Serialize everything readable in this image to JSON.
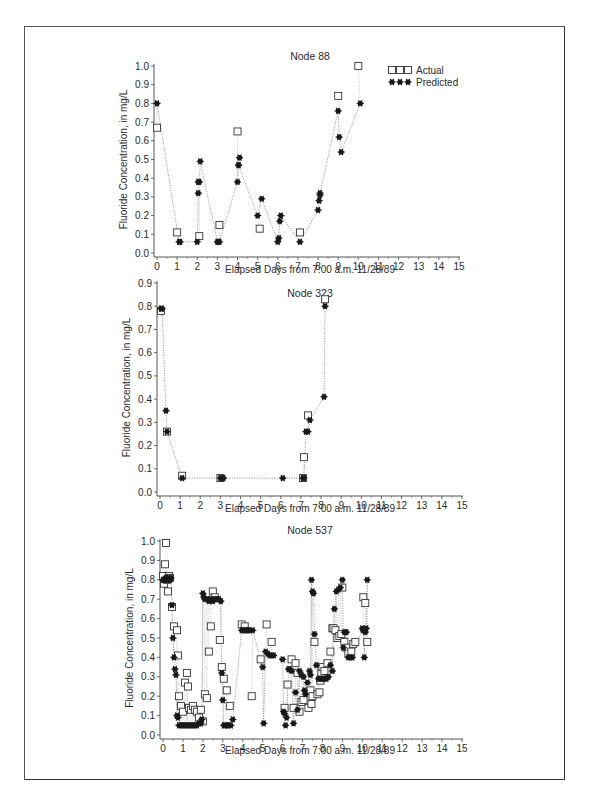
{
  "figure": {
    "caption_visible": false
  },
  "legend": {
    "actual_label": "Actual",
    "predicted_label": "Predicted",
    "actual_marker": "open-square",
    "predicted_marker": "filled-asterisk-dot"
  },
  "chart_data": [
    {
      "type": "scatter",
      "title": "Node 88",
      "xlabel": "Elapsed Days from 7:00 a.m. 11/28/89",
      "ylabel": "Fluoride Concentration, in mg/L",
      "xlim": [
        0,
        15
      ],
      "ylim": [
        0,
        1.0
      ],
      "xticks": [
        0,
        1,
        2,
        3,
        4,
        5,
        6,
        7,
        8,
        9,
        10,
        11,
        12,
        13,
        14,
        15
      ],
      "yticks": [
        0.0,
        0.1,
        0.2,
        0.3,
        0.4,
        0.5,
        0.6,
        0.7,
        0.8,
        0.9,
        1.0
      ],
      "legend_position": "top-right",
      "grid": false,
      "series": [
        {
          "name": "Actual",
          "marker": "open-square",
          "x": [
            0.0,
            1.0,
            2.1,
            3.1,
            4.0,
            5.1,
            7.1,
            9.0,
            10.0
          ],
          "y": [
            0.67,
            0.11,
            0.09,
            0.15,
            0.65,
            0.13,
            0.11,
            0.84,
            1.0
          ]
        },
        {
          "name": "Predicted",
          "marker": "filled-asterisk",
          "line": "dotted",
          "x": [
            0.0,
            1.1,
            1.15,
            2.0,
            2.05,
            2.05,
            2.1,
            2.15,
            3.0,
            3.05,
            3.1,
            4.0,
            4.05,
            4.1,
            4.05,
            5.0,
            5.2,
            6.0,
            6.05,
            6.1,
            6.15,
            7.1,
            8.0,
            8.05,
            8.1,
            8.1,
            9.0,
            9.05,
            9.15,
            10.1
          ],
          "y": [
            0.8,
            0.06,
            0.06,
            0.06,
            0.32,
            0.38,
            0.38,
            0.49,
            0.06,
            0.06,
            0.06,
            0.38,
            0.47,
            0.51,
            0.47,
            0.2,
            0.29,
            0.06,
            0.08,
            0.17,
            0.2,
            0.06,
            0.23,
            0.28,
            0.31,
            0.32,
            0.76,
            0.62,
            0.54,
            0.8
          ]
        }
      ]
    },
    {
      "type": "scatter",
      "title": "Node 323",
      "xlabel": "Elapsed Days from 7:00 a.m. 11/28/89",
      "ylabel": "Fluoride Concentration, in mg/L",
      "xlim": [
        0,
        15
      ],
      "ylim": [
        0,
        0.9
      ],
      "xticks": [
        0,
        1,
        2,
        3,
        4,
        5,
        6,
        7,
        8,
        9,
        10,
        11,
        12,
        13,
        14,
        15
      ],
      "yticks": [
        0.0,
        0.1,
        0.2,
        0.3,
        0.4,
        0.5,
        0.6,
        0.7,
        0.8,
        0.9
      ],
      "grid": false,
      "series": [
        {
          "name": "Actual",
          "marker": "open-square",
          "x": [
            0.05,
            0.35,
            1.1,
            3.0,
            7.1,
            7.15,
            7.35,
            8.2
          ],
          "y": [
            0.78,
            0.26,
            0.07,
            0.06,
            0.06,
            0.15,
            0.33,
            0.83
          ]
        },
        {
          "name": "Predicted",
          "marker": "filled-asterisk",
          "line": "dotted",
          "x": [
            0.05,
            0.1,
            0.3,
            0.35,
            1.1,
            3.0,
            3.05,
            3.15,
            6.1,
            7.1,
            7.15,
            7.25,
            7.35,
            7.45,
            8.15,
            8.2
          ],
          "y": [
            0.79,
            0.79,
            0.35,
            0.26,
            0.06,
            0.06,
            0.06,
            0.06,
            0.06,
            0.06,
            0.06,
            0.26,
            0.26,
            0.31,
            0.41,
            0.8
          ]
        }
      ]
    },
    {
      "type": "scatter",
      "title": "Node 537",
      "xlabel": "Elapsed Days from 7:00 a.m. 11/28/89",
      "ylabel": "Fluoride Concentration, in mg/L",
      "xlim": [
        0,
        15
      ],
      "ylim": [
        0,
        1.0
      ],
      "xticks": [
        0,
        1,
        2,
        3,
        4,
        5,
        6,
        7,
        8,
        9,
        10,
        11,
        12,
        13,
        14,
        15
      ],
      "yticks": [
        0.0,
        0.1,
        0.2,
        0.3,
        0.4,
        0.5,
        0.6,
        0.7,
        0.8,
        0.9,
        1.0
      ],
      "grid": false,
      "series": [
        {
          "name": "Actual",
          "marker": "open-square",
          "x": [
            0.0,
            0.05,
            0.1,
            0.15,
            0.2,
            0.25,
            0.3,
            0.35,
            0.45,
            0.55,
            0.7,
            0.75,
            0.8,
            0.9,
            1.0,
            1.1,
            1.2,
            1.25,
            1.3,
            1.4,
            1.5,
            1.6,
            1.7,
            1.8,
            1.9,
            2.0,
            2.1,
            2.2,
            2.3,
            2.4,
            2.5,
            2.6,
            2.85,
            2.95,
            3.05,
            3.2,
            3.35,
            3.95,
            4.1,
            4.45,
            4.9,
            5.2,
            5.45,
            6.1,
            6.25,
            6.45,
            6.55,
            6.65,
            6.75,
            6.85,
            6.95,
            7.05,
            7.3,
            7.4,
            7.45,
            7.5,
            7.6,
            7.75,
            7.85,
            7.9,
            7.95,
            8.0,
            8.1,
            8.25,
            8.4,
            8.5,
            8.55,
            8.65,
            8.75,
            8.85,
            8.95,
            9.0,
            9.1,
            9.2,
            9.3,
            9.45,
            9.55,
            9.65,
            10.05,
            10.15,
            10.25
          ],
          "y": [
            0.82,
            0.78,
            0.88,
            0.99,
            0.8,
            0.74,
            0.82,
            0.81,
            0.66,
            0.56,
            0.54,
            0.41,
            0.2,
            0.15,
            0.12,
            0.27,
            0.32,
            0.25,
            0.14,
            0.13,
            0.15,
            0.13,
            0.12,
            0.09,
            0.13,
            0.07,
            0.21,
            0.19,
            0.43,
            0.56,
            0.74,
            0.71,
            0.49,
            0.35,
            0.29,
            0.23,
            0.15,
            0.57,
            0.56,
            0.2,
            0.39,
            0.57,
            0.48,
            0.14,
            0.26,
            0.39,
            0.14,
            0.37,
            0.32,
            0.12,
            0.17,
            0.18,
            0.14,
            0.23,
            0.16,
            0.2,
            0.48,
            0.21,
            0.22,
            0.28,
            0.32,
            0.35,
            0.33,
            0.37,
            0.43,
            0.55,
            0.55,
            0.54,
            0.5,
            0.51,
            0.52,
            0.76,
            0.48,
            0.45,
            0.42,
            0.43,
            0.47,
            0.48,
            0.71,
            0.68,
            0.48
          ]
        },
        {
          "name": "Predicted",
          "marker": "filled-asterisk",
          "line": "dotted",
          "x": [
            0.0,
            0.05,
            0.1,
            0.15,
            0.2,
            0.25,
            0.3,
            0.35,
            0.4,
            0.45,
            0.5,
            0.55,
            0.6,
            0.65,
            0.7,
            0.75,
            0.8,
            0.9,
            1.0,
            1.1,
            1.2,
            1.3,
            1.4,
            1.5,
            1.6,
            1.7,
            1.8,
            1.9,
            1.95,
            2.0,
            2.05,
            2.1,
            2.2,
            2.3,
            2.4,
            2.5,
            2.6,
            2.7,
            2.8,
            2.9,
            2.95,
            3.0,
            3.05,
            3.1,
            3.2,
            3.3,
            3.4,
            3.5,
            3.95,
            4.05,
            4.15,
            4.25,
            4.35,
            4.5,
            5.0,
            5.05,
            5.15,
            5.25,
            5.35,
            5.45,
            5.55,
            6.0,
            6.05,
            6.1,
            6.15,
            6.2,
            6.3,
            6.35,
            6.45,
            6.55,
            6.65,
            6.75,
            6.85,
            6.95,
            7.05,
            7.1,
            7.15,
            7.25,
            7.35,
            7.4,
            7.45,
            7.5,
            7.55,
            7.6,
            7.7,
            7.8,
            7.9,
            8.0,
            8.1,
            8.2,
            8.3,
            8.4,
            8.5,
            8.6,
            8.7,
            8.8,
            8.9,
            9.0,
            9.05,
            9.1,
            9.2,
            9.3,
            9.4,
            9.5,
            10.0,
            10.05,
            10.1,
            10.15,
            10.2,
            10.25
          ],
          "y": [
            0.8,
            0.8,
            0.8,
            0.81,
            0.8,
            0.8,
            0.81,
            0.8,
            0.81,
            0.67,
            0.5,
            0.4,
            0.34,
            0.31,
            0.1,
            0.09,
            0.05,
            0.05,
            0.05,
            0.05,
            0.05,
            0.05,
            0.05,
            0.05,
            0.05,
            0.05,
            0.06,
            0.06,
            0.08,
            0.73,
            0.71,
            0.7,
            0.7,
            0.69,
            0.7,
            0.69,
            0.7,
            0.7,
            0.7,
            0.69,
            0.32,
            0.18,
            0.05,
            0.05,
            0.05,
            0.05,
            0.05,
            0.08,
            0.54,
            0.54,
            0.54,
            0.54,
            0.54,
            0.54,
            0.35,
            0.06,
            0.43,
            0.42,
            0.41,
            0.41,
            0.41,
            0.39,
            0.12,
            0.11,
            0.05,
            0.09,
            0.34,
            0.34,
            0.33,
            0.06,
            0.22,
            0.13,
            0.33,
            0.31,
            0.3,
            0.23,
            0.21,
            0.27,
            0.33,
            0.31,
            0.8,
            0.74,
            0.73,
            0.52,
            0.36,
            0.29,
            0.29,
            0.29,
            0.29,
            0.29,
            0.3,
            0.36,
            0.33,
            0.65,
            0.74,
            0.75,
            0.76,
            0.8,
            0.45,
            0.53,
            0.53,
            0.4,
            0.4,
            0.4,
            0.55,
            0.54,
            0.4,
            0.53,
            0.55,
            0.8
          ]
        }
      ]
    }
  ]
}
